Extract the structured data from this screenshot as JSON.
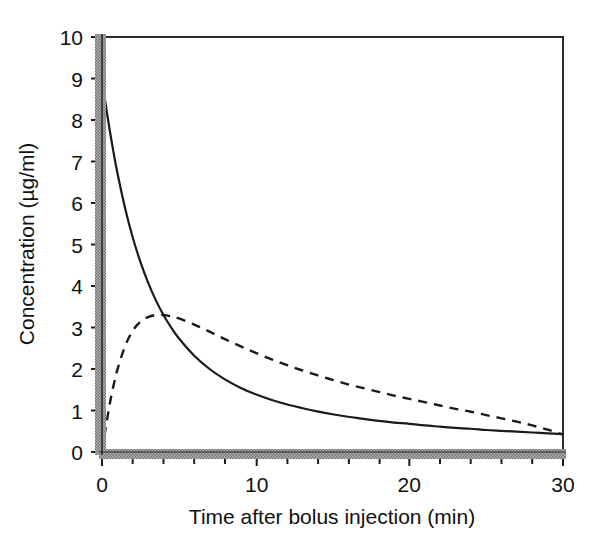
{
  "figure": {
    "background": "#ffffff",
    "frame_color": "#2b2b2b",
    "stipple_color": "#8c8c8c"
  },
  "chart_data": {
    "type": "line",
    "title": "",
    "xlabel": "Time after bolus injection (min)",
    "ylabel": "Concentration (µg/ml)",
    "xlim": [
      0,
      30
    ],
    "ylim": [
      0,
      10
    ],
    "xticks": [
      0,
      10,
      20,
      30
    ],
    "xtick_labels": [
      "0",
      "10",
      "20",
      "30"
    ],
    "xminor_ticks": [
      2,
      4,
      6,
      8,
      12,
      14,
      16,
      18,
      22,
      24,
      26,
      28
    ],
    "yticks": [
      0,
      1,
      2,
      3,
      4,
      5,
      6,
      7,
      8,
      9,
      10
    ],
    "ytick_labels": [
      "0",
      "1",
      "2",
      "3",
      "4",
      "5",
      "6",
      "7",
      "8",
      "9",
      "10"
    ],
    "grid": false,
    "legend": null,
    "series": [
      {
        "name": "bolus injection (solid)",
        "style": "solid",
        "color": "#1a1a1a",
        "linewidth": 2.0,
        "x": [
          0,
          0.25,
          0.5,
          0.75,
          1,
          1.5,
          2,
          2.5,
          3,
          3.5,
          4,
          4.5,
          5,
          6,
          7,
          8,
          9,
          10,
          11,
          12,
          13,
          14,
          15,
          16,
          17,
          18,
          19,
          20,
          21,
          22,
          23,
          24,
          25,
          26,
          27,
          28,
          29,
          30
        ],
        "y": [
          9.0,
          8.35,
          7.76,
          7.22,
          6.73,
          5.88,
          5.17,
          4.58,
          4.08,
          3.66,
          3.3,
          3.0,
          2.74,
          2.32,
          2.0,
          1.75,
          1.55,
          1.39,
          1.26,
          1.15,
          1.06,
          0.98,
          0.91,
          0.85,
          0.8,
          0.75,
          0.71,
          0.68,
          0.64,
          0.61,
          0.58,
          0.56,
          0.53,
          0.51,
          0.49,
          0.47,
          0.45,
          0.43
        ]
      },
      {
        "name": "infusion (dashed)",
        "style": "dashed",
        "color": "#1a1a1a",
        "linewidth": 2.0,
        "x": [
          0,
          0.25,
          0.5,
          0.75,
          1,
          1.5,
          2,
          2.5,
          3,
          3.5,
          4,
          4.5,
          5,
          6,
          7,
          8,
          9,
          10,
          11,
          12,
          13,
          14,
          15,
          16,
          17,
          18,
          19,
          20,
          21,
          22,
          23,
          24,
          25,
          26,
          27,
          28,
          29,
          30
        ],
        "y": [
          0.0,
          0.6,
          1.15,
          1.6,
          1.98,
          2.55,
          2.92,
          3.14,
          3.25,
          3.3,
          3.3,
          3.27,
          3.22,
          3.07,
          2.9,
          2.72,
          2.55,
          2.39,
          2.24,
          2.1,
          1.97,
          1.85,
          1.74,
          1.63,
          1.54,
          1.45,
          1.36,
          1.28,
          1.2,
          1.12,
          1.04,
          0.97,
          0.89,
          0.81,
          0.73,
          0.64,
          0.54,
          0.42
        ]
      }
    ],
    "annotations": [
      {
        "name": "left-axis-stipple-band",
        "description": "stippled grey vertical band overlaying left spine"
      },
      {
        "name": "bottom-axis-stipple-band",
        "description": "stippled grey horizontal band overlaying bottom spine"
      }
    ]
  }
}
